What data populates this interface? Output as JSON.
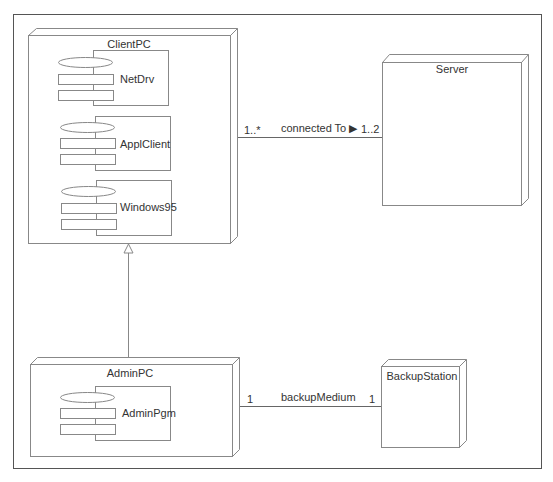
{
  "diagram": {
    "type": "UML deployment diagram",
    "colors": {
      "line": "#666666",
      "frame": "#555555",
      "text": "#333333",
      "background": "#ffffff"
    },
    "nodes": [
      {
        "id": "clientpc",
        "name": "ClientPC",
        "components": [
          {
            "name": "NetDrv"
          },
          {
            "name": "ApplClient"
          },
          {
            "name": "Windows95"
          }
        ]
      },
      {
        "id": "server",
        "name": "Server",
        "components": []
      },
      {
        "id": "adminpc",
        "name": "AdminPC",
        "components": [
          {
            "name": "AdminPgm"
          }
        ]
      },
      {
        "id": "backupstation",
        "name": "BackupStation",
        "components": []
      }
    ],
    "associations": [
      {
        "from": "ClientPC",
        "to": "Server",
        "label": "connected To ▶",
        "from_multiplicity": "1..*",
        "to_multiplicity": "1..2"
      },
      {
        "from": "AdminPC",
        "to": "BackupStation",
        "label": "backupMedium",
        "from_multiplicity": "1",
        "to_multiplicity": "1"
      }
    ],
    "generalizations": [
      {
        "child": "AdminPC",
        "parent": "ClientPC"
      }
    ]
  }
}
